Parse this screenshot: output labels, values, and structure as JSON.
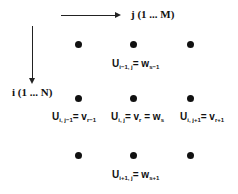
{
  "axes": {
    "j_label": "j (1 ... M)",
    "i_label": "i (1 ... N)"
  },
  "grid": {
    "rows": 3,
    "cols": 3,
    "dot_color": "#111111"
  },
  "labels": {
    "top": {
      "base": "U",
      "sub": "i−1, j",
      "rhs": "= w",
      "rhs_sub": "s−1"
    },
    "left": {
      "base": "U",
      "sub": "i, j−1",
      "rhs": "= v",
      "rhs_sub": "r−1"
    },
    "center": {
      "base": "U",
      "sub": "i, j",
      "rhs": "= v",
      "rhs_sub": "r",
      "rhs2": " = w",
      "rhs2_sub": "s"
    },
    "right": {
      "base": "U",
      "sub": "i, j+1",
      "rhs": "= v",
      "rhs_sub": "r+1"
    },
    "bottom": {
      "base": "U",
      "sub": "i+1, j",
      "rhs": "= w",
      "rhs_sub": "s+1"
    }
  }
}
